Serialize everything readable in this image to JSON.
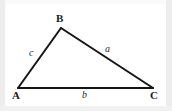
{
  "figure": {
    "background_color": "#ffffff",
    "frame_color": "#ededee",
    "stroke_color": "#151515",
    "label_color": "#1b1b1b",
    "width": 172,
    "height": 111
  },
  "diagram": {
    "type": "triangle",
    "vertices": [
      {
        "name": "A",
        "label": "A",
        "x": 18,
        "y": 88,
        "position": "bottom-left"
      },
      {
        "name": "B",
        "label": "B",
        "x": 61,
        "y": 28,
        "position": "top"
      },
      {
        "name": "C",
        "label": "C",
        "x": 153,
        "y": 88,
        "position": "bottom-right"
      }
    ],
    "sides": [
      {
        "name": "a",
        "label": "a",
        "from": "B",
        "to": "C",
        "style": "italic",
        "label_x": 109,
        "label_y": 49
      },
      {
        "name": "b",
        "label": "b",
        "from": "A",
        "to": "C",
        "style": "italic",
        "label_x": 86,
        "label_y": 95
      },
      {
        "name": "c",
        "label": "c",
        "from": "A",
        "to": "B",
        "style": "italic",
        "label_x": 32,
        "label_y": 53
      }
    ],
    "stroke_width": 2
  }
}
